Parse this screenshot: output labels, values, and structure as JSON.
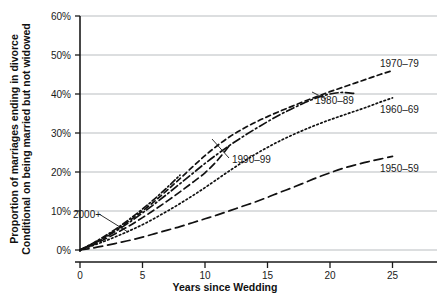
{
  "chart_data": {
    "type": "line",
    "title": "",
    "xlabel": "Years since Wedding",
    "ylabel": "Proportion of marriages ending in divorce\nConditional on being married but not widowed",
    "ylabel_line1": "Proportion of marriages ending in divorce",
    "ylabel_line2": "Conditional on being married but not widowed",
    "xlim": [
      0,
      28
    ],
    "ylim": [
      0,
      60
    ],
    "xticks": [
      0,
      5,
      10,
      15,
      20,
      25
    ],
    "xtick_labels": [
      "0",
      "5",
      "10",
      "15",
      "20",
      "25"
    ],
    "yticks": [
      0,
      10,
      20,
      30,
      40,
      50,
      60
    ],
    "ytick_labels": [
      "0%",
      "10%",
      "20%",
      "30%",
      "40%",
      "50%",
      "60%"
    ],
    "grid": "horizontal",
    "legend_position": "inline-labels",
    "series": [
      {
        "name": "1950–59",
        "label": "1950–59",
        "dash": "long-dash",
        "x": [
          0,
          1,
          2,
          3,
          4,
          5,
          6,
          7,
          8,
          9,
          10,
          11,
          12,
          13,
          14,
          15,
          16,
          17,
          18,
          19,
          20,
          21,
          22,
          23,
          24,
          25
        ],
        "values": [
          0,
          0.5,
          1.1,
          1.8,
          2.5,
          3.3,
          4.2,
          5.1,
          6.0,
          7.0,
          8.0,
          9.0,
          10.1,
          11.2,
          12.3,
          13.5,
          14.8,
          16.0,
          17.3,
          18.6,
          19.8,
          20.9,
          21.8,
          22.6,
          23.3,
          24.0
        ]
      },
      {
        "name": "1960–69",
        "label": "1960–69",
        "dash": "dotted",
        "x": [
          0,
          1,
          2,
          3,
          4,
          5,
          6,
          7,
          8,
          9,
          10,
          11,
          12,
          13,
          14,
          15,
          16,
          17,
          18,
          19,
          20,
          21,
          22,
          23,
          24,
          25
        ],
        "values": [
          0,
          1.1,
          2.3,
          3.6,
          5.0,
          6.5,
          8.2,
          10.0,
          11.9,
          13.9,
          16.0,
          18.2,
          20.4,
          22.5,
          24.5,
          26.3,
          28.0,
          29.5,
          30.9,
          32.2,
          33.4,
          34.5,
          35.6,
          36.7,
          37.9,
          39.0
        ]
      },
      {
        "name": "1970–79",
        "label": "1970–79",
        "dash": "short-dash",
        "x": [
          0,
          1,
          2,
          3,
          4,
          5,
          6,
          7,
          8,
          9,
          10,
          11,
          12,
          13,
          14,
          15,
          16,
          17,
          18,
          19,
          20,
          21,
          22,
          23,
          24,
          25
        ],
        "values": [
          0,
          1.6,
          3.4,
          5.4,
          7.6,
          10.0,
          12.6,
          15.4,
          18.3,
          21.3,
          24.2,
          26.8,
          29.1,
          31.0,
          32.7,
          34.2,
          35.6,
          36.9,
          38.2,
          39.4,
          40.6,
          41.7,
          42.8,
          43.9,
          45.0,
          46.0
        ]
      },
      {
        "name": "1980–89",
        "label": "1980–89",
        "dash": "dash-dot",
        "x": [
          0,
          1,
          2,
          3,
          4,
          5,
          6,
          7,
          8,
          9,
          10,
          11,
          12,
          13,
          14,
          15,
          16,
          17,
          18,
          19,
          20,
          21,
          22
        ],
        "values": [
          0,
          1.5,
          3.2,
          5.1,
          7.2,
          9.5,
          11.9,
          14.4,
          17.0,
          19.6,
          22.2,
          24.6,
          26.9,
          29.0,
          31.0,
          32.9,
          34.7,
          36.3,
          37.8,
          39.1,
          40.0,
          40.4,
          40.1
        ]
      },
      {
        "name": "1990–99",
        "label": "1990–99",
        "dash": "medium-dash",
        "x": [
          0,
          1,
          2,
          3,
          4,
          5,
          6,
          7,
          8,
          9,
          10,
          11,
          12
        ],
        "values": [
          0,
          1.3,
          2.8,
          4.5,
          6.3,
          8.3,
          10.4,
          12.6,
          14.9,
          17.3,
          19.8,
          23.0,
          27.0
        ]
      },
      {
        "name": "2000+",
        "label": "2000+",
        "dash": "dash-dot-short",
        "x": [
          0,
          1,
          2,
          3,
          4,
          5,
          6,
          7,
          8
        ],
        "values": [
          0,
          1.7,
          3.6,
          5.7,
          8.0,
          10.5,
          13.2,
          16.1,
          19.2
        ]
      }
    ],
    "annotations": [
      {
        "text": "1970–79",
        "x_px": 380,
        "y_px": 67
      },
      {
        "text": "1980–89",
        "x_px": 315,
        "y_px": 104
      },
      {
        "text": "1960–69",
        "x_px": 380,
        "y_px": 113
      },
      {
        "text": "1990–99",
        "x_px": 232,
        "y_px": 163
      },
      {
        "text": "1950–59",
        "x_px": 380,
        "y_px": 172
      },
      {
        "text": "2000+",
        "x_px": 73,
        "y_px": 218
      }
    ],
    "colors": {
      "line": "#111111",
      "grid": "#b9bdc0",
      "axis": "#1a1a1a",
      "background": "#ffffff",
      "text": "#1a1a1a"
    }
  }
}
